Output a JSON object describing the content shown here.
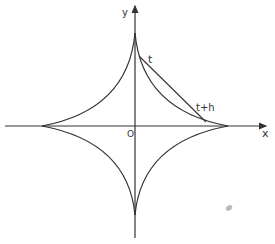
{
  "diagram": {
    "labels": {
      "x_axis": "x",
      "y_axis": "y",
      "origin": "O",
      "point_t": "t",
      "point_t_plus_h": "t+h"
    },
    "colors": {
      "stroke": "#333333",
      "background": "#ffffff",
      "smudge": "#bbbbbb"
    }
  }
}
